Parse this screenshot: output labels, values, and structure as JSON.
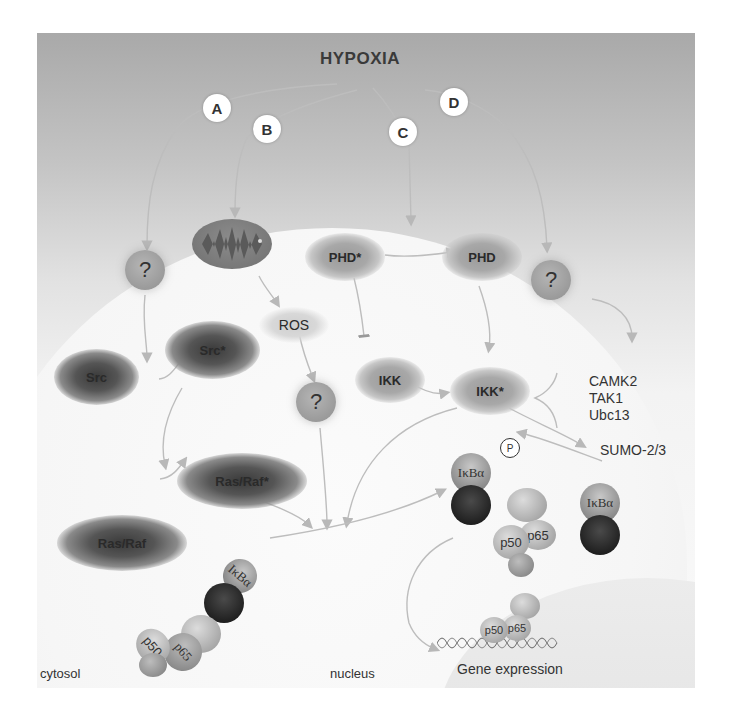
{
  "diagram": {
    "title": "HYPOXIA",
    "pathway_badges": [
      "A",
      "B",
      "C",
      "D"
    ],
    "nodes": {
      "unknown_a": "?",
      "unknown_d": "?",
      "unknown_ros": "?",
      "mitochondrion": "mitochondrion",
      "phd_star": "PHD*",
      "phd": "PHD",
      "ros": "ROS",
      "src_star": "Src*",
      "src": "Src",
      "ikk": "IKK",
      "ikk_star": "IKK*",
      "ras_raf_star": "Ras/Raf*",
      "ras_raf": "Ras/Raf",
      "sumo": "SUMO-2/3",
      "kinases": [
        "CAMK2",
        "TAK1",
        "Ubc13"
      ]
    },
    "complexes": {
      "ikba": "IκBα",
      "phospho": "P",
      "p50": "p50",
      "p65": "p65"
    },
    "compartments": {
      "cytosol": "cytosol",
      "nucleus": "nucleus"
    },
    "outcome": "Gene expression",
    "colors": {
      "background_top": "#a9a9a9",
      "cell": "#f6f6f6",
      "arrow": "#b8b8b8",
      "text": "#333333"
    }
  }
}
